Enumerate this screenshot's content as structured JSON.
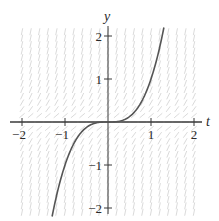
{
  "chart_data": {
    "type": "line",
    "title": "",
    "subtitle": "",
    "xlabel": "t",
    "ylabel": "y",
    "xlim": [
      -2.3,
      2.3
    ],
    "ylim": [
      -2.3,
      2.3
    ],
    "grid": false,
    "legend": null,
    "x_ticks": [
      -2,
      -1,
      1,
      2
    ],
    "x_tick_labels": [
      "−2",
      "−1",
      "1",
      "2"
    ],
    "y_ticks": [
      -2,
      -1,
      1,
      2
    ],
    "y_tick_labels": [
      "−2",
      "−1",
      "1",
      "2"
    ],
    "slope_field": {
      "description": "direction field, near-vertical segments away from y=0, flattening toward the t-axis",
      "color": "#cfcfcf"
    },
    "series": [
      {
        "name": "solution curve",
        "description": "y = t^3",
        "color": "#555555",
        "x": [
          -1.3,
          -1.2,
          -1.0,
          -0.8,
          -0.6,
          -0.4,
          -0.2,
          0.0,
          0.2,
          0.4,
          0.6,
          0.8,
          1.0,
          1.2,
          1.3
        ],
        "values": [
          -2.197,
          -1.728,
          -1.0,
          -0.512,
          -0.216,
          -0.064,
          -0.008,
          0.0,
          0.008,
          0.064,
          0.216,
          0.512,
          1.0,
          1.728,
          2.197
        ]
      }
    ]
  },
  "colors": {
    "axis": "#3a3a3a",
    "curve": "#555555",
    "field": "#d0d0d0",
    "background": "#ffffff"
  }
}
